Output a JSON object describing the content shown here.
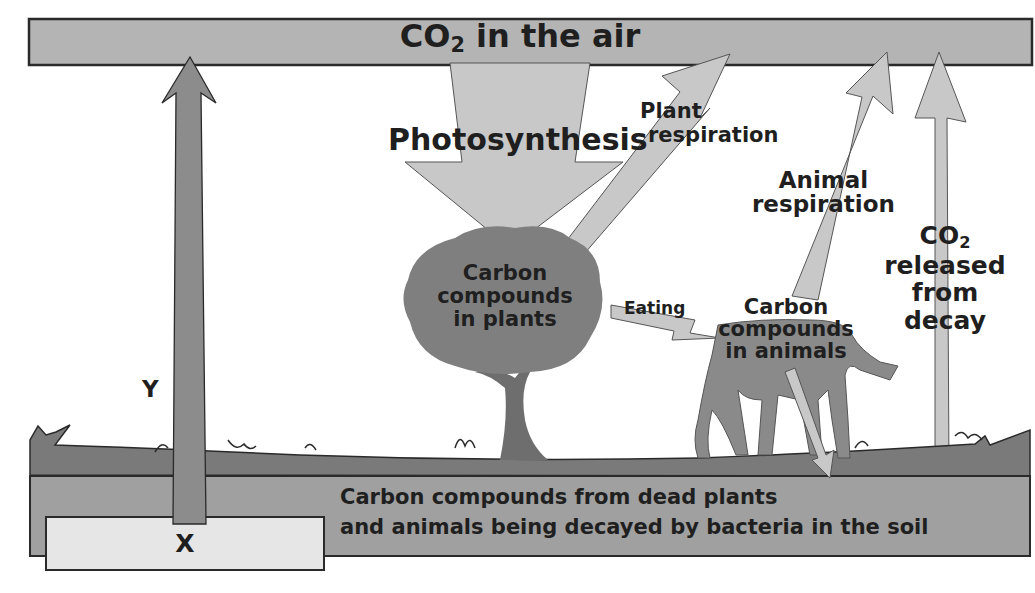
{
  "diagram": {
    "air_box": {
      "label_prefix": "CO",
      "label_sub": "2",
      "label_suffix": " in the air"
    },
    "photosynthesis": {
      "label": "Photosynthesis"
    },
    "plant_respiration": {
      "line1": "Plant",
      "line2": "respiration"
    },
    "animal_respiration": {
      "line1": "Animal",
      "line2": "respiration"
    },
    "co2_decay": {
      "line0_prefix": "CO",
      "line0_sub": "2",
      "line1": "released",
      "line2": "from",
      "line3": "decay"
    },
    "plants": {
      "line1": "Carbon",
      "line2": "compounds",
      "line3": "in plants"
    },
    "eating": {
      "label": "Eating"
    },
    "animals": {
      "line1": "Carbon",
      "line2": "compounds",
      "line3": "in animals"
    },
    "soil": {
      "line1": "Carbon compounds from dead plants",
      "line2": "and animals being decayed by bacteria in the soil"
    },
    "x_box": {
      "label": "X"
    },
    "y_arrow": {
      "label": "Y"
    }
  },
  "colors": {
    "air_box": "#b4b4b4",
    "arrow_light": "#c8c8c8",
    "arrow_dark": "#8c8c8c",
    "ground": "#7a7a7a",
    "soil": "#a0a0a0",
    "x_box": "#e6e6e6",
    "tree": "#7f7f7f",
    "horse": "#8a8a8a",
    "text": "#1f1f1f",
    "outline": "#2a2a2a"
  }
}
